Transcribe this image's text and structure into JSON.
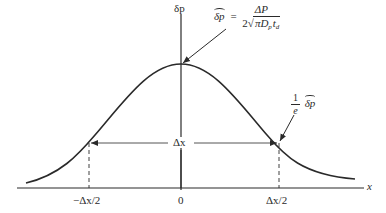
{
  "diagram": {
    "y_axis_label": "δp",
    "x_axis_label": "x",
    "peak_annotation": {
      "lhs": "δp",
      "equals": "=",
      "numerator": "ΔP",
      "denominator_coeff": "2",
      "sqrt_symbol": "√",
      "denominator_radicand_pi": "π",
      "denominator_D": "D",
      "denominator_D_sub": "p",
      "denominator_t": "t",
      "denominator_t_sub": "d"
    },
    "falloff_annotation": {
      "numerator": "1",
      "denominator": "e",
      "term": "δp"
    },
    "width_label": "Δx",
    "ticks": [
      {
        "label": "−Δx/2"
      },
      {
        "label": "0"
      },
      {
        "label": "Δx/2"
      }
    ],
    "colors": {
      "ink": "#2a2a2a",
      "background": "#ffffff"
    }
  }
}
